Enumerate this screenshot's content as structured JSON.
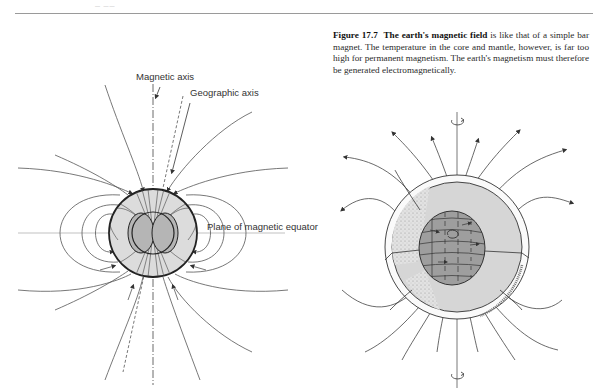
{
  "page": {
    "header_mark": "— ——"
  },
  "caption": {
    "figure_number": "Figure 17.7",
    "bold_title": "The earth's magnetic field",
    "body": " is like that of a simple bar magnet. The temperature in the core and mantle, however, is far too high for permanent magnetism. The earth's magnetism must therefore be generated electromagnetically."
  },
  "left_diagram": {
    "labels": {
      "magnetic_axis": "Magnetic axis",
      "geographic_axis": "Geographic axis",
      "magnetic_equator": "Plane of magnetic equator"
    }
  },
  "right_diagram": {
    "description": "Cutaway earth showing core convection currents and dipole field lines with rotation axis"
  },
  "colors": {
    "line": "#444444",
    "shell_fill": "#d9d9d9",
    "core_fill": "#a8a8a8",
    "text": "#2a2a2a"
  }
}
